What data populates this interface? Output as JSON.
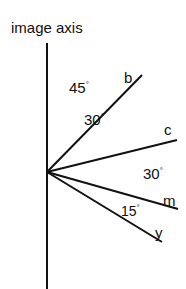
{
  "title": "image axis",
  "lines": [
    {
      "label": "b"
    },
    {
      "label": "c"
    },
    {
      "label": "m"
    },
    {
      "label": "y"
    }
  ],
  "angles": [
    {
      "value": "45",
      "unit": "°"
    },
    {
      "value": "30",
      "unit": "°"
    },
    {
      "value": "30",
      "unit": "°"
    },
    {
      "value": "15",
      "unit": "°"
    }
  ]
}
